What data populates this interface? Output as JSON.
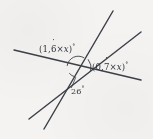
{
  "figure": {
    "kind": "geometry-diagram",
    "background_color": "#f4f3f1",
    "ink_color": "#3c4048",
    "width": 153,
    "height": 139,
    "intersection": {
      "x": 78,
      "y": 68
    },
    "lines": [
      {
        "name": "near-horizontal-line",
        "x1": 14,
        "y1": 50,
        "x2": 141,
        "y2": 80
      },
      {
        "name": "steep-line",
        "x1": 113,
        "y1": 11,
        "x2": 44,
        "y2": 129
      },
      {
        "name": "diagonal-line",
        "x1": 141,
        "y1": 32,
        "x2": 29,
        "y2": 119
      }
    ],
    "arcs": [
      {
        "name": "upper-angle-arc",
        "radius": 11
      },
      {
        "name": "right-angle-arc",
        "radius": 13
      },
      {
        "name": "lower-angle-arc",
        "radius": 9
      }
    ]
  },
  "labels": {
    "left_angle": {
      "open_paren": "(",
      "integer_part": "1",
      "decimal_separator": ",",
      "repeating_digit": "6",
      "times": "×",
      "variable": "x",
      "close_paren": ")",
      "degree": "°",
      "plain": "(1,6̇ × x)°"
    },
    "right_angle": {
      "open_paren": "(",
      "integer_part": "0",
      "decimal_separator": ",",
      "repeating_digit": "7",
      "times": "×",
      "variable": "x",
      "close_paren": ")",
      "degree": "°",
      "plain": "(0,7̇ × x)°"
    },
    "bottom_angle": {
      "value": "26",
      "degree": "°",
      "plain": "26°"
    }
  }
}
